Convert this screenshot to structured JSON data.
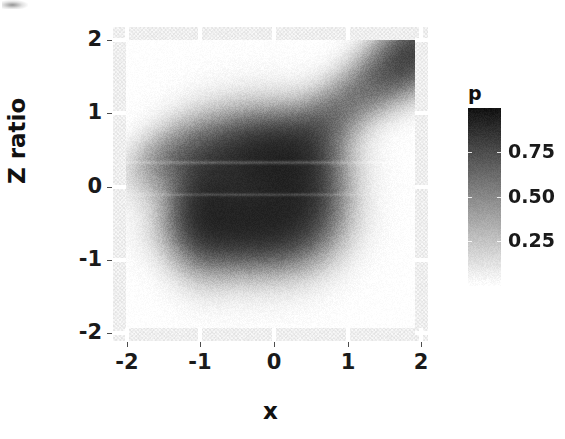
{
  "chart_data": {
    "type": "heatmap",
    "title": "",
    "xlabel": "x",
    "ylabel": "Z ratio",
    "xlim": [
      -2.2,
      2.2
    ],
    "ylim": [
      -2.2,
      2.2
    ],
    "xticks": [
      -2,
      -1,
      0,
      1,
      2
    ],
    "xticklabels": [
      "-2",
      "-1",
      "0",
      "1",
      "2"
    ],
    "yticks": [
      -2,
      -1,
      0,
      1,
      2
    ],
    "yticklabels": [
      "-2",
      "-1",
      "0",
      "1",
      "2"
    ],
    "grid": false,
    "colormap": "grayscale-reversed",
    "colorbar": {
      "title": "p",
      "ticks": [
        0.25,
        0.5,
        0.75
      ],
      "ticklabels": [
        "0.25",
        "0.50",
        "0.75"
      ],
      "vmin": 0.0,
      "vmax": 1.0,
      "position": "right",
      "low_color": "#ffffff",
      "high_color": "#1a1a1a"
    },
    "density_components": [
      {
        "name": "main-blob-core",
        "cx": -0.2,
        "cy": -0.12,
        "sx": 0.62,
        "sy": 0.6,
        "rot": 0.1,
        "amp": 1.0
      },
      {
        "name": "main-blob-upper",
        "cx": -0.15,
        "cy": 0.45,
        "sx": 0.55,
        "sy": 0.34,
        "rot": 0.05,
        "amp": 0.88
      },
      {
        "name": "main-blob-lower",
        "cx": -0.3,
        "cy": -0.62,
        "sx": 0.58,
        "sy": 0.34,
        "rot": 0.0,
        "amp": 0.9
      },
      {
        "name": "blob-right-shoulder",
        "cx": 0.45,
        "cy": -0.05,
        "sx": 0.36,
        "sy": 0.52,
        "rot": 0.0,
        "amp": 0.82
      },
      {
        "name": "blob-left-edge",
        "cx": -0.95,
        "cy": -0.3,
        "sx": 0.3,
        "sy": 0.52,
        "rot": 0.0,
        "amp": 0.8
      },
      {
        "name": "left-tail",
        "cx": -1.45,
        "cy": 0.35,
        "sx": 0.38,
        "sy": 0.26,
        "rot": 0.55,
        "amp": 0.34
      },
      {
        "name": "diagonal-ridge-mid",
        "cx": 1.3,
        "cy": 1.32,
        "sx": 0.6,
        "sy": 0.26,
        "rot": 0.72,
        "amp": 0.42
      },
      {
        "name": "diagonal-ridge-far",
        "cx": 2.05,
        "cy": 1.85,
        "sx": 0.48,
        "sy": 0.3,
        "rot": 0.72,
        "amp": 0.92
      },
      {
        "name": "ridge-bridge",
        "cx": 0.7,
        "cy": 0.85,
        "sx": 0.42,
        "sy": 0.26,
        "rot": 0.7,
        "amp": 0.26
      }
    ],
    "streak_artifacts": [
      {
        "name": "light-streak-upper",
        "y": 0.3,
        "thickness": 0.018,
        "lighten": 0.2
      },
      {
        "name": "light-streak-lower",
        "y": -0.15,
        "thickness": 0.016,
        "lighten": 0.16
      }
    ]
  },
  "axes": {
    "x": {
      "title": "x",
      "ticks": [
        {
          "label": "-2",
          "px": 127
        },
        {
          "label": "-1",
          "px": 200
        },
        {
          "label": "0",
          "px": 274
        },
        {
          "label": "1",
          "px": 348
        },
        {
          "label": "2",
          "px": 421
        }
      ]
    },
    "y": {
      "title": "Z ratio",
      "ticks": [
        {
          "label": "2",
          "px": 40
        },
        {
          "label": "1",
          "px": 113
        },
        {
          "label": "0",
          "px": 187
        },
        {
          "label": "-1",
          "px": 260
        },
        {
          "label": "-2",
          "px": 333
        }
      ]
    }
  },
  "legend": {
    "title": "p",
    "ticks": [
      {
        "label": "0.75",
        "value": 0.75
      },
      {
        "label": "0.50",
        "value": 0.5
      },
      {
        "label": "0.25",
        "value": 0.25
      }
    ]
  }
}
